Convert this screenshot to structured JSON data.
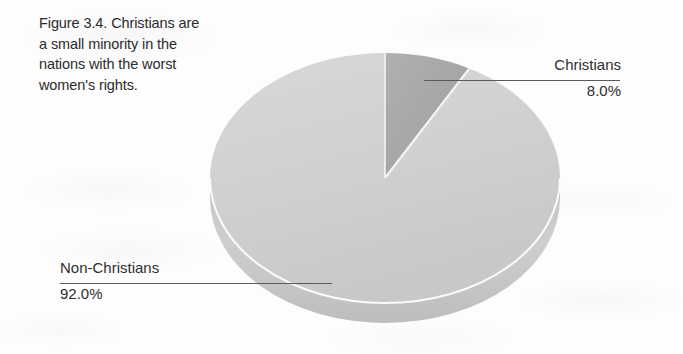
{
  "figure": {
    "caption_lines": [
      "Figure 3.4. Christians are",
      "a small minority in the",
      "nations with the worst",
      "women's rights."
    ]
  },
  "labels": {
    "christians": {
      "category": "Christians",
      "percent": "8.0%"
    },
    "non_christians": {
      "category": "Non-Christians",
      "percent": "92.0%"
    }
  },
  "chart_data": {
    "type": "pie",
    "title": "Figure 3.4. Christians are a small minority in the nations with the worst women's rights.",
    "categories": [
      "Christians",
      "Non-Christians"
    ],
    "values": [
      8.0,
      92.0
    ],
    "value_labels": [
      "8.0%",
      "92.0%"
    ],
    "units": "percent",
    "three_d": true,
    "start_angle_deg": 0,
    "direction": "clockwise",
    "legend": "none",
    "data_labels_position": "outside-with-leader-lines",
    "colors": {
      "christians": "#a9a9a9",
      "non_christians": "#d2d2d2",
      "christians_side": "#8f8f8f",
      "non_christians_side": "#bcbcbc",
      "separator": "#f2f2f2",
      "leader_line": "#5a5a5a",
      "text": "#2b2b2b",
      "background": "#fdfdfd"
    }
  }
}
